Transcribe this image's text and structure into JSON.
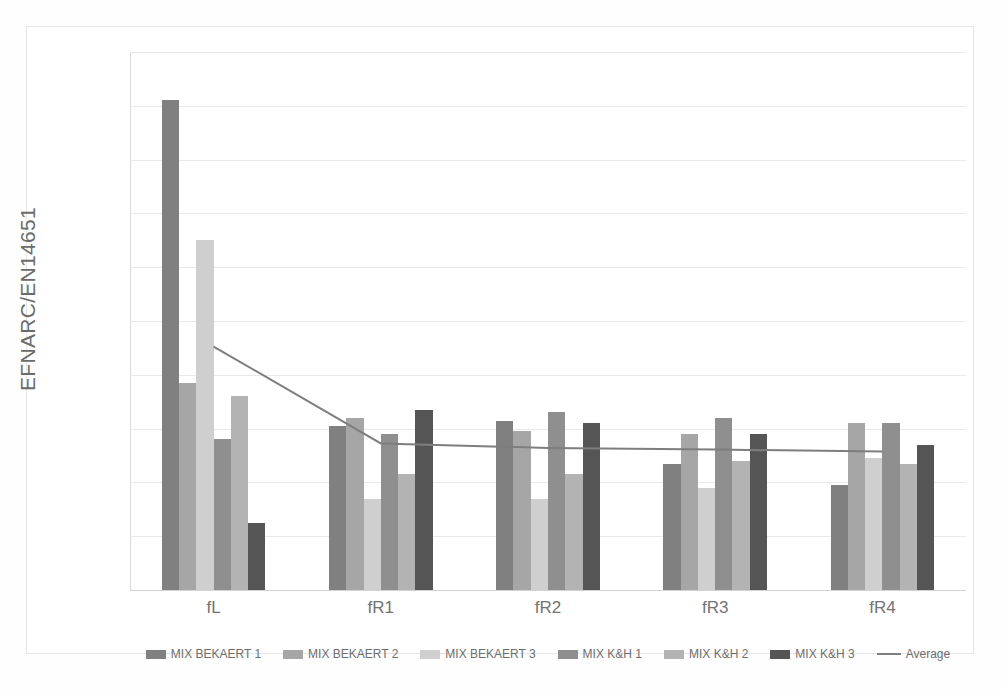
{
  "chart_data": {
    "type": "bar",
    "title": "",
    "xlabel": "",
    "ylabel": "EFNARC/EN14651",
    "categories": [
      "fL",
      "fR1",
      "fR2",
      "fR3",
      "fR4"
    ],
    "ylim": [
      0,
      2
    ],
    "y_ticks": [
      "0",
      "0.2",
      "0.4",
      "0.6",
      "0.8",
      "1",
      "1.2",
      "1.4",
      "1.6",
      "1.8",
      "2"
    ],
    "y_tick_values": [
      0,
      0.2,
      0.4,
      0.6,
      0.8,
      1.0,
      1.2,
      1.4,
      1.6,
      1.8,
      2.0
    ],
    "grid": true,
    "legend_position": "bottom",
    "series": [
      {
        "name": "MIX BEKAERT 1",
        "color": "#808080",
        "values": [
          1.82,
          0.61,
          0.63,
          0.47,
          0.39
        ]
      },
      {
        "name": "MIX BEKAERT 2",
        "color": "#a6a6a6",
        "values": [
          0.77,
          0.64,
          0.59,
          0.58,
          0.62
        ]
      },
      {
        "name": "MIX BEKAERT 3",
        "color": "#cfcfcf",
        "values": [
          1.3,
          0.34,
          0.34,
          0.38,
          0.49
        ]
      },
      {
        "name": "MIX K&H 1",
        "color": "#8f8f8f",
        "values": [
          0.56,
          0.58,
          0.66,
          0.64,
          0.62
        ]
      },
      {
        "name": "MIX K&H 2",
        "color": "#b3b3b3",
        "values": [
          0.72,
          0.43,
          0.43,
          0.48,
          0.47
        ]
      },
      {
        "name": "MIX K&H 3",
        "color": "#555555",
        "values": [
          0.25,
          0.67,
          0.62,
          0.58,
          0.54
        ]
      }
    ],
    "line_series": {
      "name": "Average",
      "color": "#7e7e7e",
      "values": [
        0.905,
        0.545,
        0.528,
        0.522,
        0.515
      ]
    }
  },
  "legend": {
    "items": [
      {
        "label": "MIX BEKAERT 1",
        "type": "swatch"
      },
      {
        "label": "MIX BEKAERT 2",
        "type": "swatch"
      },
      {
        "label": "MIX BEKAERT 3",
        "type": "swatch"
      },
      {
        "label": "MIX K&H 1",
        "type": "swatch"
      },
      {
        "label": "MIX K&H 2",
        "type": "swatch"
      },
      {
        "label": "MIX K&H 3",
        "type": "swatch"
      },
      {
        "label": "Average",
        "type": "line"
      }
    ]
  }
}
